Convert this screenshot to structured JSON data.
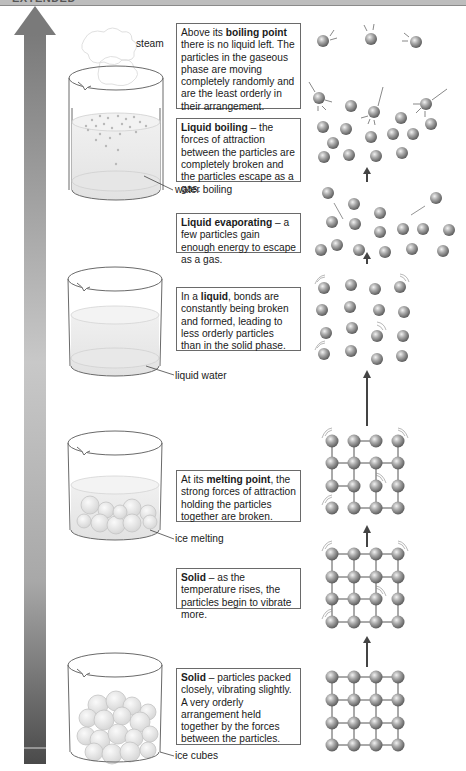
{
  "header": {
    "label": "EXTENDED"
  },
  "arrow": {
    "direction": "up",
    "meaning": "increasing temperature",
    "top_color": "#7a7a7a",
    "bottom_color": "#4a4a4a"
  },
  "beakers": [
    {
      "id": "steam",
      "label": "steam",
      "state": "boiling with steam"
    },
    {
      "id": "boiling",
      "label": "water boiling"
    },
    {
      "id": "liquid",
      "label": "liquid water"
    },
    {
      "id": "melting",
      "label": "ice melting"
    },
    {
      "id": "ice",
      "label": "ice cubes"
    }
  ],
  "boxes": [
    {
      "id": "gas",
      "bold": "boiling point",
      "pre": "Above its ",
      "post": " there is no liquid left. The particles in the gaseous phase are moving completely randomly and are the least orderly in their arrangement."
    },
    {
      "id": "boiling",
      "bold": "Liquid boiling",
      "pre": "",
      "post": " – the forces of attraction between the particles are completely broken and the particles escape as a gas."
    },
    {
      "id": "evaporating",
      "bold": "Liquid evaporating",
      "pre": "",
      "post": " – a few particles gain enough energy to escape as a gas."
    },
    {
      "id": "liquid",
      "bold": "liquid",
      "pre": "In a ",
      "post": ", bonds are constantly being broken and formed, leading to less orderly particles than in the solid phase."
    },
    {
      "id": "melting",
      "bold": "melting point",
      "pre": "At its ",
      "post": ", the strong forces of attraction holding the particles together are broken."
    },
    {
      "id": "solid-vibrating",
      "bold": "Solid",
      "pre": "",
      "post": " – as the temperature rises, the particles begin to vibrate more."
    },
    {
      "id": "solid",
      "bold": "Solid",
      "pre": "",
      "post": " – particles packed closely, vibrating slightly. A very orderly arrangement held together by the forces between the particles."
    }
  ],
  "colors": {
    "particle": "#9a9a9a",
    "particle_highlight": "#e6e6e6",
    "bond": "#555555",
    "box_border": "#6a6a6a"
  }
}
